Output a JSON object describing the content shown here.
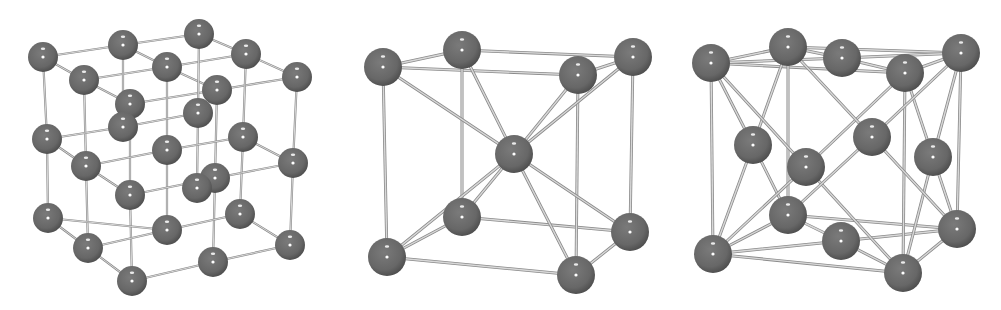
{
  "figure": {
    "colors": {
      "atom": "#6e6e6e",
      "atom_dark": "#4f4f4f",
      "highlight": "#ffffff",
      "bond": "#b8b8b8",
      "bond_dark": "#8a8a8a",
      "background": "#ffffff"
    },
    "panels": [
      {
        "name": "simple-cubic-lattice",
        "radius": 15,
        "atoms": [
          [
            199,
            34
          ],
          [
            123,
            45
          ],
          [
            246,
            54
          ],
          [
            43,
            57
          ],
          [
            167,
            67
          ],
          [
            297,
            77
          ],
          [
            84,
            80
          ],
          [
            217,
            90
          ],
          [
            130,
            104
          ],
          [
            198,
            113
          ],
          [
            123,
            127
          ],
          [
            243,
            137
          ],
          [
            47,
            139
          ],
          [
            167,
            150
          ],
          [
            293,
            163
          ],
          [
            86,
            166
          ],
          [
            215,
            178
          ],
          [
            197,
            188
          ],
          [
            130,
            195
          ],
          [
            240,
            214
          ],
          [
            48,
            218
          ],
          [
            167,
            230
          ],
          [
            290,
            245
          ],
          [
            88,
            248
          ],
          [
            213,
            262
          ],
          [
            132,
            281
          ]
        ],
        "bonds": [
          [
            [
              43,
              57
            ],
            [
              123,
              45
            ]
          ],
          [
            [
              123,
              45
            ],
            [
              199,
              34
            ]
          ],
          [
            [
              199,
              34
            ],
            [
              246,
              54
            ]
          ],
          [
            [
              246,
              54
            ],
            [
              297,
              77
            ]
          ],
          [
            [
              43,
              57
            ],
            [
              84,
              80
            ]
          ],
          [
            [
              84,
              80
            ],
            [
              130,
              104
            ]
          ],
          [
            [
              123,
              45
            ],
            [
              167,
              67
            ]
          ],
          [
            [
              167,
              67
            ],
            [
              217,
              90
            ]
          ],
          [
            [
              84,
              80
            ],
            [
              167,
              67
            ]
          ],
          [
            [
              167,
              67
            ],
            [
              246,
              54
            ]
          ],
          [
            [
              130,
              104
            ],
            [
              217,
              90
            ]
          ],
          [
            [
              217,
              90
            ],
            [
              297,
              77
            ]
          ],
          [
            [
              43,
              57
            ],
            [
              47,
              139
            ]
          ],
          [
            [
              47,
              139
            ],
            [
              48,
              218
            ]
          ],
          [
            [
              84,
              80
            ],
            [
              86,
              166
            ]
          ],
          [
            [
              86,
              166
            ],
            [
              88,
              248
            ]
          ],
          [
            [
              130,
              104
            ],
            [
              130,
              195
            ]
          ],
          [
            [
              130,
              195
            ],
            [
              132,
              281
            ]
          ],
          [
            [
              297,
              77
            ],
            [
              293,
              163
            ]
          ],
          [
            [
              293,
              163
            ],
            [
              290,
              245
            ]
          ],
          [
            [
              217,
              90
            ],
            [
              215,
              178
            ]
          ],
          [
            [
              215,
              178
            ],
            [
              213,
              262
            ]
          ],
          [
            [
              123,
              45
            ],
            [
              123,
              127
            ]
          ],
          [
            [
              167,
              67
            ],
            [
              167,
              150
            ]
          ],
          [
            [
              167,
              150
            ],
            [
              167,
              230
            ]
          ],
          [
            [
              246,
              54
            ],
            [
              243,
              137
            ]
          ],
          [
            [
              243,
              137
            ],
            [
              240,
              214
            ]
          ],
          [
            [
              199,
              34
            ],
            [
              198,
              113
            ]
          ],
          [
            [
              198,
              113
            ],
            [
              197,
              188
            ]
          ],
          [
            [
              47,
              139
            ],
            [
              86,
              166
            ]
          ],
          [
            [
              86,
              166
            ],
            [
              130,
              195
            ]
          ],
          [
            [
              47,
              139
            ],
            [
              123,
              127
            ]
          ],
          [
            [
              123,
              127
            ],
            [
              198,
              113
            ]
          ],
          [
            [
              86,
              166
            ],
            [
              167,
              150
            ]
          ],
          [
            [
              167,
              150
            ],
            [
              243,
              137
            ]
          ],
          [
            [
              130,
              195
            ],
            [
              215,
              178
            ]
          ],
          [
            [
              215,
              178
            ],
            [
              293,
              163
            ]
          ],
          [
            [
              243,
              137
            ],
            [
              293,
              163
            ]
          ],
          [
            [
              48,
              218
            ],
            [
              88,
              248
            ]
          ],
          [
            [
              88,
              248
            ],
            [
              132,
              281
            ]
          ],
          [
            [
              48,
              218
            ],
            [
              167,
              230
            ]
          ],
          [
            [
              167,
              230
            ],
            [
              240,
              214
            ]
          ],
          [
            [
              88,
              248
            ],
            [
              167,
              230
            ]
          ],
          [
            [
              132,
              281
            ],
            [
              213,
              262
            ]
          ],
          [
            [
              213,
              262
            ],
            [
              290,
              245
            ]
          ],
          [
            [
              240,
              214
            ],
            [
              290,
              245
            ]
          ]
        ]
      },
      {
        "name": "body-centered-cubic-lattice",
        "radius": 19,
        "atoms": [
          [
            462,
            50
          ],
          [
            633,
            57
          ],
          [
            383,
            67
          ],
          [
            578,
            75
          ],
          [
            514,
            154
          ],
          [
            462,
            217
          ],
          [
            630,
            232
          ],
          [
            387,
            257
          ],
          [
            576,
            275
          ]
        ],
        "bonds": [
          [
            [
              383,
              67
            ],
            [
              462,
              50
            ]
          ],
          [
            [
              462,
              50
            ],
            [
              633,
              57
            ]
          ],
          [
            [
              383,
              67
            ],
            [
              578,
              75
            ]
          ],
          [
            [
              578,
              75
            ],
            [
              633,
              57
            ]
          ],
          [
            [
              387,
              257
            ],
            [
              462,
              217
            ]
          ],
          [
            [
              462,
              217
            ],
            [
              630,
              232
            ]
          ],
          [
            [
              387,
              257
            ],
            [
              576,
              275
            ]
          ],
          [
            [
              576,
              275
            ],
            [
              630,
              232
            ]
          ],
          [
            [
              383,
              67
            ],
            [
              387,
              257
            ]
          ],
          [
            [
              462,
              50
            ],
            [
              462,
              217
            ]
          ],
          [
            [
              578,
              75
            ],
            [
              576,
              275
            ]
          ],
          [
            [
              633,
              57
            ],
            [
              630,
              232
            ]
          ],
          [
            [
              514,
              154
            ],
            [
              383,
              67
            ]
          ],
          [
            [
              514,
              154
            ],
            [
              462,
              50
            ]
          ],
          [
            [
              514,
              154
            ],
            [
              578,
              75
            ]
          ],
          [
            [
              514,
              154
            ],
            [
              633,
              57
            ]
          ],
          [
            [
              514,
              154
            ],
            [
              387,
              257
            ]
          ],
          [
            [
              514,
              154
            ],
            [
              462,
              217
            ]
          ],
          [
            [
              514,
              154
            ],
            [
              576,
              275
            ]
          ],
          [
            [
              514,
              154
            ],
            [
              630,
              232
            ]
          ]
        ]
      },
      {
        "name": "face-centered-cubic-lattice",
        "radius": 19,
        "atoms": [
          [
            788,
            47
          ],
          [
            961,
            53
          ],
          [
            842,
            58
          ],
          [
            711,
            63
          ],
          [
            905,
            73
          ],
          [
            872,
            137
          ],
          [
            753,
            145
          ],
          [
            933,
            157
          ],
          [
            806,
            167
          ],
          [
            788,
            215
          ],
          [
            957,
            229
          ],
          [
            841,
            241
          ],
          [
            713,
            254
          ],
          [
            903,
            273
          ]
        ],
        "bonds": [
          [
            [
              711,
              63
            ],
            [
              788,
              47
            ]
          ],
          [
            [
              788,
              47
            ],
            [
              961,
              53
            ]
          ],
          [
            [
              711,
              63
            ],
            [
              905,
              73
            ]
          ],
          [
            [
              905,
              73
            ],
            [
              961,
              53
            ]
          ],
          [
            [
              711,
              63
            ],
            [
              842,
              58
            ]
          ],
          [
            [
              842,
              58
            ],
            [
              905,
              73
            ]
          ],
          [
            [
              788,
              47
            ],
            [
              842,
              58
            ]
          ],
          [
            [
              842,
              58
            ],
            [
              961,
              53
            ]
          ],
          [
            [
              713,
              254
            ],
            [
              788,
              215
            ]
          ],
          [
            [
              788,
              215
            ],
            [
              957,
              229
            ]
          ],
          [
            [
              713,
              254
            ],
            [
              903,
              273
            ]
          ],
          [
            [
              903,
              273
            ],
            [
              957,
              229
            ]
          ],
          [
            [
              713,
              254
            ],
            [
              841,
              241
            ]
          ],
          [
            [
              841,
              241
            ],
            [
              903,
              273
            ]
          ],
          [
            [
              788,
              215
            ],
            [
              841,
              241
            ]
          ],
          [
            [
              841,
              241
            ],
            [
              957,
              229
            ]
          ],
          [
            [
              711,
              63
            ],
            [
              713,
              254
            ]
          ],
          [
            [
              788,
              47
            ],
            [
              788,
              215
            ]
          ],
          [
            [
              905,
              73
            ],
            [
              903,
              273
            ]
          ],
          [
            [
              961,
              53
            ],
            [
              957,
              229
            ]
          ],
          [
            [
              753,
              145
            ],
            [
              711,
              63
            ]
          ],
          [
            [
              753,
              145
            ],
            [
              788,
              47
            ]
          ],
          [
            [
              753,
              145
            ],
            [
              713,
              254
            ]
          ],
          [
            [
              753,
              145
            ],
            [
              788,
              215
            ]
          ],
          [
            [
              933,
              157
            ],
            [
              905,
              73
            ]
          ],
          [
            [
              933,
              157
            ],
            [
              961,
              53
            ]
          ],
          [
            [
              933,
              157
            ],
            [
              903,
              273
            ]
          ],
          [
            [
              933,
              157
            ],
            [
              957,
              229
            ]
          ],
          [
            [
              806,
              167
            ],
            [
              711,
              63
            ]
          ],
          [
            [
              806,
              167
            ],
            [
              905,
              73
            ]
          ],
          [
            [
              806,
              167
            ],
            [
              713,
              254
            ]
          ],
          [
            [
              806,
              167
            ],
            [
              903,
              273
            ]
          ],
          [
            [
              872,
              137
            ],
            [
              788,
              47
            ]
          ],
          [
            [
              872,
              137
            ],
            [
              961,
              53
            ]
          ],
          [
            [
              872,
              137
            ],
            [
              788,
              215
            ]
          ],
          [
            [
              872,
              137
            ],
            [
              957,
              229
            ]
          ]
        ]
      }
    ]
  }
}
